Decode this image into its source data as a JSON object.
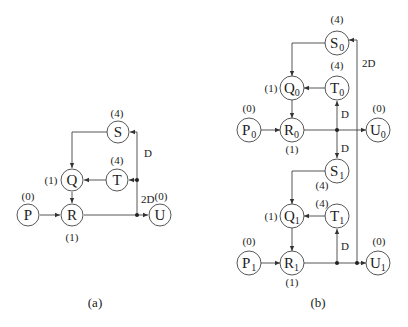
{
  "diagram_a": {
    "caption": "(a)",
    "nodes": [
      {
        "id": "S",
        "label": "S",
        "sub": "",
        "weight": "(4)",
        "x": 118,
        "y": 132
      },
      {
        "id": "T",
        "label": "T",
        "sub": "",
        "weight": "(4)",
        "x": 117,
        "y": 180
      },
      {
        "id": "Q",
        "label": "Q",
        "sub": "",
        "weight": "(1)",
        "x": 72,
        "y": 180
      },
      {
        "id": "P",
        "label": "P",
        "sub": "",
        "weight": "(0)",
        "x": 28,
        "y": 215
      },
      {
        "id": "R",
        "label": "R",
        "sub": "",
        "weight": "(1)",
        "x": 72,
        "y": 215
      },
      {
        "id": "U",
        "label": "U",
        "sub": "",
        "weight": "(0)",
        "x": 160,
        "y": 215
      }
    ],
    "edge_labels": {
      "d": "D",
      "two_d": "2D"
    }
  },
  "diagram_b": {
    "caption": "(b)",
    "nodes": [
      {
        "id": "S0",
        "label": "S",
        "sub": "0",
        "weight": "(4)"
      },
      {
        "id": "T0",
        "label": "T",
        "sub": "0",
        "weight": "(4)"
      },
      {
        "id": "Q0",
        "label": "Q",
        "sub": "0",
        "weight": "(1)"
      },
      {
        "id": "P0",
        "label": "P",
        "sub": "0",
        "weight": "(0)"
      },
      {
        "id": "R0",
        "label": "R",
        "sub": "0",
        "weight": "(1)"
      },
      {
        "id": "U0",
        "label": "U",
        "sub": "0",
        "weight": "(0)"
      },
      {
        "id": "S1",
        "label": "S",
        "sub": "1",
        "weight": "(4)"
      },
      {
        "id": "T1",
        "label": "T",
        "sub": "1",
        "weight": "(4)"
      },
      {
        "id": "Q1",
        "label": "Q",
        "sub": "1",
        "weight": "(1)"
      },
      {
        "id": "P1",
        "label": "P",
        "sub": "1",
        "weight": "(0)"
      },
      {
        "id": "R1",
        "label": "R",
        "sub": "1",
        "weight": "(1)"
      },
      {
        "id": "U1",
        "label": "U",
        "sub": "1",
        "weight": "(0)"
      }
    ],
    "edge_labels": {
      "d_top": "D",
      "d_mid": "D",
      "d_bottom": "D",
      "two_d": "2D"
    }
  }
}
